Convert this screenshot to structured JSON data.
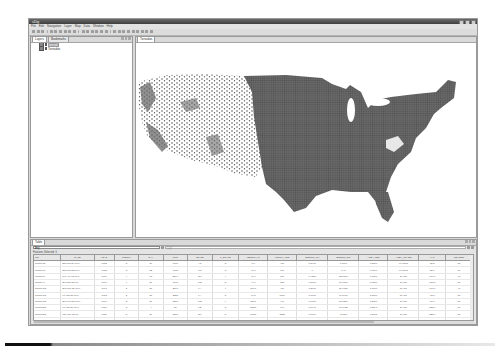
{
  "window": {
    "title": "uDig",
    "controls": [
      "minimize",
      "maximize",
      "close"
    ]
  },
  "menubar": {
    "items": [
      "File",
      "Edit",
      "Navigation",
      "Layer",
      "Map",
      "Data",
      "Window",
      "Help"
    ]
  },
  "toolbar": {
    "icons": [
      "new-icon",
      "save-icon",
      "print-icon",
      "undo-icon",
      "redo-icon",
      "cut-icon",
      "copy-icon",
      "paste-icon",
      "delete-icon",
      "zoom-in-icon",
      "zoom-out-icon",
      "pan-icon",
      "zoom-extent-icon",
      "refresh-icon",
      "info-icon",
      "select-icon",
      "edit-icon",
      "add-point-icon",
      "add-line-icon",
      "add-polygon-icon",
      "measure-icon",
      "back-icon",
      "forward-icon",
      "run-icon"
    ]
  },
  "left_panel": {
    "tabs": [
      {
        "label": "Layers",
        "active": true
      },
      {
        "label": "Bookmarks",
        "active": false
      }
    ],
    "layers": [
      {
        "label": "tornad",
        "selected": true,
        "checked": true
      },
      {
        "label": "Tornados",
        "selected": false,
        "checked": true
      }
    ]
  },
  "map_panel": {
    "tab_label": "Tornados",
    "point_color": "#5a5a5a"
  },
  "table_panel": {
    "tab_label": "Table",
    "filter_value": "Any",
    "expression_placeholder": "CQL",
    "status": "Features Selected: 0",
    "columns": [
      "FID",
      "DATE",
      "YEAR",
      "MONTH",
      "DAY",
      "UTC",
      "STATE",
      "F_SCALE",
      "LENGTH_M",
      "WIDTH_YDS",
      "SPECFL_FM",
      "SPECFL_DM",
      "AREA_LEN",
      "AREA_CLASS",
      "LAT",
      "SEASON"
    ],
    "rows": [
      [
        "tornad.12",
        "Sat Mar 29 00:0..",
        "1952",
        "3",
        "29",
        "1900",
        "AR",
        "3",
        "8.0",
        "400",
        "0.2400",
        "1.0017",
        "0.5500",
        "MACRO",
        "35.5",
        "50"
      ],
      [
        "tornad.18",
        "Sat Mar 22 00:0..",
        "1952",
        "3",
        "22",
        "1615",
        "TN",
        "3",
        "46.8",
        "770",
        "0",
        "6.40",
        "0.6700",
        "MACRO",
        "35.6",
        "86"
      ],
      [
        "tornad.19",
        "Tue Apr 18 00:0..",
        "1970",
        "4",
        "18",
        "2346",
        "OK",
        "4",
        "46.6",
        "870",
        "0.4250",
        "23.0000",
        "1.0800",
        "GIANT",
        "177.7",
        "41"
      ],
      [
        "tornad.44",
        "Sun Sep 27 00..",
        "1971",
        "9",
        "27",
        "1700",
        "MS",
        "3",
        "44.9",
        "373",
        "0.5000",
        "17.1000",
        "1.0500",
        "GIANT",
        "158.5",
        "50"
      ],
      [
        "tornad.105",
        "Sun Mar 21 00:0..",
        "1971",
        "2",
        "21",
        "2240",
        "LA",
        "4",
        "150.0",
        "400",
        "0.2000",
        "30.9027",
        "1.0600",
        "GIANT",
        "168.1",
        "41"
      ],
      [
        "tornad.177",
        "Fri Mar 21 00:0..",
        "1952",
        "3",
        "21",
        "2321",
        "LA",
        "3",
        "14.5",
        "1759",
        "0.0600",
        "14.5477",
        "1.5000",
        "GIANT",
        "73.0",
        "50"
      ],
      [
        "tornad.181",
        "Sun Feb 21 00:0..",
        "1971",
        "2",
        "21",
        "2200",
        "MS",
        "4",
        "150.1",
        "440",
        "0.6600",
        "30.8271",
        "1.2800",
        "GIANT",
        "81.6",
        "50"
      ],
      [
        "tornad.200",
        "Fri Mar 26 00:0..",
        "1950",
        "3",
        "4",
        "50",
        "KS",
        "3",
        "202.5",
        "140",
        "0.0947",
        "17.1425",
        "1.2241",
        "GIANT",
        "325.8",
        "50"
      ],
      [
        "tornad.201",
        "Thu May 26 00..",
        "1955",
        "5",
        "26",
        "2000",
        "OK",
        "5",
        "183.5",
        "1320",
        "0.7084",
        "40.288",
        "1.5005",
        "GIANT",
        "325.8",
        "50"
      ],
      [
        "tornad.203",
        "Tue Jun 08 00:0..",
        "1953",
        "6",
        "8",
        "2030",
        "MI",
        "5",
        "34.0",
        "880",
        "0.5700",
        "17.0203",
        "1.2511",
        "GIANT",
        "85.2",
        "86"
      ],
      [
        "tornad.226",
        "Mon May 11 00..",
        "1953",
        "5",
        "11",
        "2210",
        "TX",
        "5",
        "20.5",
        "583",
        "0.3313",
        "6.0620",
        "0.8482",
        "MACRO",
        "61.9",
        "116"
      ],
      [
        "tornad.228",
        "Tue Jun 09 00:0..",
        "1953",
        "6",
        "9",
        "1335",
        "MA",
        "4",
        "18.6",
        "800",
        "0.4753",
        "8.8450",
        "0.8616",
        "MACRO",
        "83.7",
        "116"
      ]
    ]
  },
  "colors": {
    "window_chrome": "#d8d8d8",
    "titlebar": "#4a4a4a",
    "points": "#5a5a5a"
  }
}
